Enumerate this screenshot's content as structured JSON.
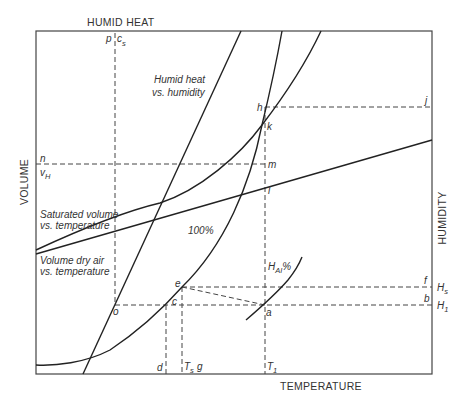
{
  "diagram": {
    "axes": {
      "top": "HUMID HEAT",
      "left": "VOLUME",
      "right": "HUMIDITY",
      "bottom": "TEMPERATURE"
    },
    "curves": {
      "humid_heat_1": "Humid heat",
      "humid_heat_2": "vs. humidity",
      "sat_vol_1": "Saturated volume",
      "sat_vol_2": "vs. temperature",
      "dry_vol_1": "Volume dry air",
      "dry_vol_2": "vs. temperature",
      "saturation": "100%",
      "rel_hum_main": "H",
      "rel_hum_sub": "AI",
      "rel_hum_pct": "%"
    },
    "points": {
      "p": "p",
      "cs_main": "c",
      "cs_sub": "s",
      "n": "n",
      "vH_main": "v",
      "vH_sub": "H",
      "h": "h",
      "j": "j",
      "k": "k",
      "m": "m",
      "l": "l",
      "o": "o",
      "e": "e",
      "c": "c",
      "a": "a",
      "f": "f",
      "b": "b",
      "d": "d",
      "Ts_main": "T",
      "Ts_sub": "s",
      "g": "g",
      "T1_main": "T",
      "T1_sub": "1",
      "Hs_main": "H",
      "Hs_sub": "s",
      "H1_main": "H",
      "H1_sub": "1"
    }
  }
}
